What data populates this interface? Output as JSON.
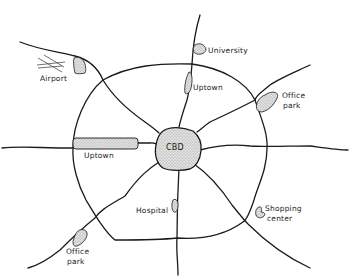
{
  "diagram": {
    "type": "urban-structure-map",
    "center": "CBD",
    "labels": {
      "cbd": "CBD",
      "university": "University",
      "uptown_north": "Uptown",
      "uptown_west": "Uptown",
      "airport": "Airport",
      "office_park_ne_line1": "Office",
      "office_park_ne_line2": "park",
      "office_park_sw_line1": "Office",
      "office_park_sw_line2": "park",
      "hospital": "Hospital",
      "shopping_line1": "Shopping",
      "shopping_line2": "center"
    },
    "colors": {
      "line": "#1a1a1a",
      "fill": "#d9d9d9",
      "background": "#ffffff"
    },
    "elements": [
      {
        "name": "CBD",
        "kind": "central-business-district"
      },
      {
        "name": "Ring road",
        "kind": "beltway"
      },
      {
        "name": "Radial highways",
        "count": 8
      },
      {
        "name": "University",
        "kind": "node"
      },
      {
        "name": "Uptown",
        "kind": "node",
        "position": "north"
      },
      {
        "name": "Uptown",
        "kind": "node",
        "position": "west"
      },
      {
        "name": "Airport",
        "kind": "node"
      },
      {
        "name": "Office park",
        "kind": "node",
        "position": "northeast"
      },
      {
        "name": "Office park",
        "kind": "node",
        "position": "southwest"
      },
      {
        "name": "Hospital",
        "kind": "node"
      },
      {
        "name": "Shopping center",
        "kind": "node"
      }
    ]
  }
}
